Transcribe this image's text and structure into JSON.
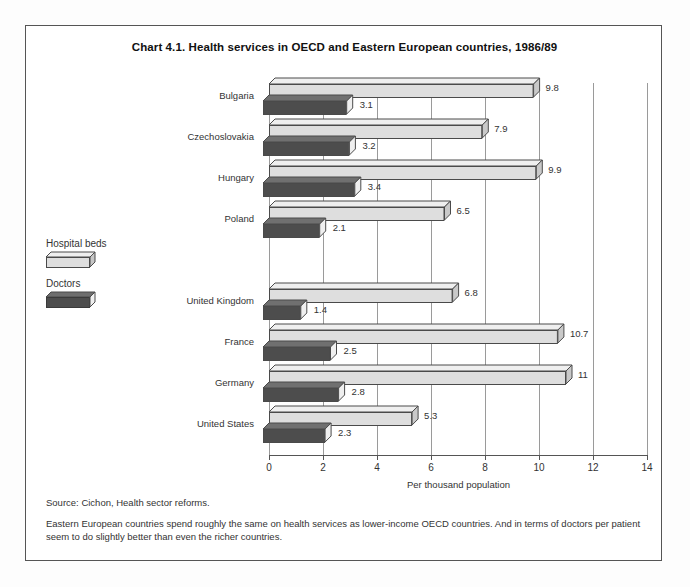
{
  "chart_data": {
    "type": "bar",
    "orientation": "horizontal",
    "title": "Chart 4.1.  Health services in OECD and Eastern European countries, 1986/89",
    "xlabel": "Per thousand population",
    "ylabel": "",
    "xlim": [
      0,
      14
    ],
    "xticks": [
      0,
      2,
      4,
      6,
      8,
      10,
      12,
      14
    ],
    "xticklabels": [
      "0",
      "2",
      "4",
      "6",
      "8",
      "10",
      "12",
      "14"
    ],
    "grid": "vertical",
    "legend_position": "left-outside",
    "categories": [
      "Bulgaria",
      "Czechoslovakia",
      "Hungary",
      "Poland",
      "",
      "United Kingdom",
      "France",
      "Germany",
      "United States"
    ],
    "series": [
      {
        "name": "Hospital beds",
        "color": "#dedede",
        "values": [
          9.8,
          7.9,
          9.9,
          6.5,
          null,
          6.8,
          10.7,
          11,
          5.3
        ],
        "labels": [
          "9.8",
          "7.9",
          "9.9",
          "6.5",
          "",
          "6.8",
          "10.7",
          "11",
          "5.3"
        ]
      },
      {
        "name": "Doctors",
        "color": "#4d4d4d",
        "values": [
          3.1,
          3.2,
          3.4,
          2.1,
          null,
          1.4,
          2.5,
          2.8,
          2.3
        ],
        "labels": [
          "3.1",
          "3.2",
          "3.4",
          "2.1",
          "",
          "1.4",
          "2.5",
          "2.8",
          "2.3"
        ]
      }
    ]
  },
  "legend": {
    "beds_label": "Hospital beds",
    "doctors_label": "Doctors"
  },
  "footnotes": {
    "source": "Source: Cichon, Health sector reforms.",
    "note": "Eastern European  countries spend roughly the same on health services as lower-income OECD countries. And in terms of doctors per patient seem to do slightly better than even the richer countries."
  }
}
